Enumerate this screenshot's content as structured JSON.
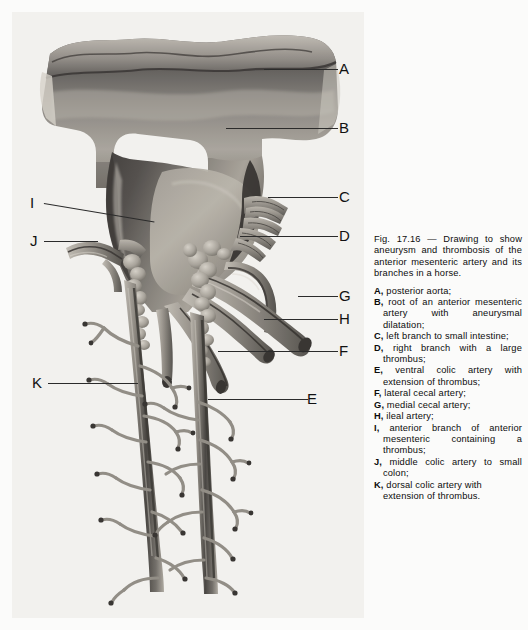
{
  "figure": {
    "plate_label": "anterior-mesenteric-artery-aneurysm-plate",
    "alt": "Drawing of the posterior aorta with aneurysm and thrombosis of the anterior mesenteric artery and its branches in a horse"
  },
  "caption": {
    "fig_number": "Fig.    17.16",
    "dash": "—",
    "title": "Drawing to show aneurysm and thrombosis of the anterior mesenteric artery and its branches in a horse.",
    "items": [
      {
        "key": "A,",
        "text": "posterior aorta;"
      },
      {
        "key": "B,",
        "text": "root of an anterior mesenteric artery with aneurysmal dilatation;"
      },
      {
        "key": "C,",
        "text": "left branch to small intestine;"
      },
      {
        "key": "D,",
        "text": "right branch with a large thrombus;"
      },
      {
        "key": "E,",
        "text": "ventral colic artery with extension of thrombus;"
      },
      {
        "key": "F,",
        "text": "lateral cecal artery;"
      },
      {
        "key": "G,",
        "text": "medial cecal artery;"
      },
      {
        "key": "H,",
        "text": "ileal artery;"
      },
      {
        "key": "I,",
        "text": "anterior branch of anterior mesenteric containing a thrombus;"
      },
      {
        "key": "J,",
        "text": "middle colic artery to small colon;"
      },
      {
        "key": "K,",
        "text": "dorsal colic artery with extension of thrombus."
      }
    ]
  },
  "labels": {
    "A": "A",
    "B": "B",
    "C": "C",
    "D": "D",
    "E": "E",
    "F": "F",
    "G": "G",
    "H": "H",
    "I": "I",
    "J": "J",
    "K": "K"
  },
  "colors": {
    "paper": "#fbfbfa",
    "plate_bg": "#f2f1ee",
    "ink": "#111111",
    "leader": "#2b2b2b",
    "vessel_dark": "#4a4744",
    "vessel_mid": "#8c8883",
    "vessel_light": "#bdb9b2",
    "lumen_shadow": "#2e2b29",
    "thrombus": "#9a958d"
  }
}
